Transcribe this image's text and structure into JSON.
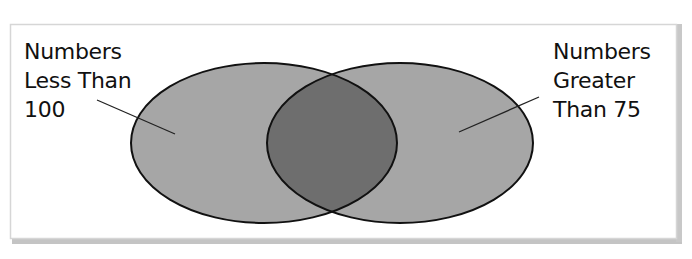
{
  "diagram": {
    "type": "venn",
    "sets": [
      {
        "id": "A",
        "label": "Numbers\nLess Than\n100"
      },
      {
        "id": "B",
        "label": "Numbers\nGreater\nThan 75"
      }
    ],
    "colors": {
      "set_fill": "#a6a6a6",
      "overlap_fill": "#6e6e6e",
      "outline": "#111111",
      "frame_border": "#d4d4d4",
      "frame_shadow": "#bdbdbd",
      "background": "#ffffff"
    }
  }
}
